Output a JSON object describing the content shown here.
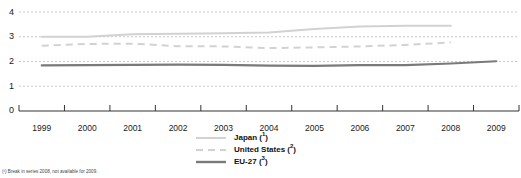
{
  "chart_data": {
    "type": "line",
    "title": "",
    "subtitle": "",
    "xlabel": "",
    "ylabel": "",
    "x": [
      "1999",
      "2000",
      "2001",
      "2002",
      "2003",
      "2004",
      "2005",
      "2006",
      "2007",
      "2008",
      "2009"
    ],
    "xlim": [
      "1999",
      "2009"
    ],
    "ylim": [
      0,
      4
    ],
    "y_ticks": [
      "0",
      "1",
      "2",
      "3",
      "4"
    ],
    "grid": "horizontal-dotted",
    "legend_position": "bottom-center",
    "series": [
      {
        "name": "Japan",
        "footnote_marker": "1",
        "color": "#d2d2d2",
        "style": "solid",
        "width": 2.0,
        "values": [
          3.0,
          3.0,
          3.1,
          3.12,
          3.14,
          3.17,
          3.31,
          3.41,
          3.44,
          3.44,
          null
        ]
      },
      {
        "name": "United States",
        "footnote_marker": "2",
        "color": "#d2d2d2",
        "style": "dashed",
        "width": 2.0,
        "values": [
          2.64,
          2.71,
          2.72,
          2.62,
          2.61,
          2.54,
          2.57,
          2.61,
          2.67,
          2.77,
          null
        ]
      },
      {
        "name": "EU-27",
        "footnote_marker": "3",
        "color": "#7a7a7a",
        "style": "solid",
        "width": 2.2,
        "values": [
          1.84,
          1.85,
          1.86,
          1.87,
          1.86,
          1.83,
          1.82,
          1.85,
          1.85,
          1.92,
          2.01
        ]
      }
    ]
  },
  "axis": {
    "y_labels": [
      "4",
      "3",
      "2",
      "1",
      "0"
    ],
    "x_labels": [
      "1999",
      "2000",
      "2001",
      "2002",
      "2003",
      "2004",
      "2005",
      "2006",
      "2007",
      "2008",
      "2009"
    ]
  },
  "legend": {
    "items": [
      {
        "label": "Japan",
        "marker": "1"
      },
      {
        "label": "United States",
        "marker": "2"
      },
      {
        "label": "EU-27",
        "marker": "3"
      }
    ]
  },
  "footnote": {
    "text": "(¹) Break in series 2008, not available for 2009."
  },
  "colors": {
    "light_line": "#d2d2d2",
    "dark_line": "#7a7a7a",
    "grid": "#c8c8c8",
    "axis": "#333333",
    "text": "#1a1a1a"
  }
}
